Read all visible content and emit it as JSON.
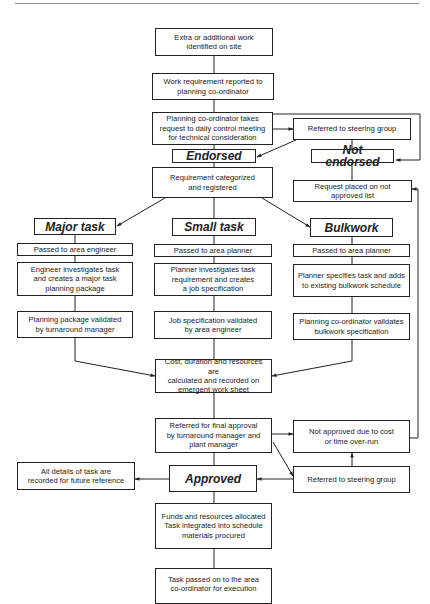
{
  "diagram": {
    "type": "flowchart",
    "nodes": {
      "extra_work": "Extra or additional work\nidentified on site",
      "work_requirement": "Work requirement reported to\nplanning co-ordinator",
      "planning_coordinator": "Planning co-ordinator takes\nrequest to daily control meeting\nfor technical consideration",
      "referred_steering_top": "Referred to steering group",
      "endorsed": "Endorsed",
      "not_endorsed": "Not  endorsed",
      "requirement_categorized": "Requirement categorized\nand registered",
      "request_not_approved_list": "Request placed on not\napproved list",
      "major_task": "Major  task",
      "small_task": "Small  task",
      "bulkwork": "Bulkwork",
      "passed_area_engineer": "Passed to area engineer",
      "passed_area_planner_small": "Passed to area planner",
      "passed_area_planner_bulk": "Passed to area planner",
      "engineer_investigates": "Engineer investigates task\nand creates a major task\nplanning package",
      "planner_investigates": "Planner investigates task\nrequirement and creates\na job specification",
      "planner_specifies": "Planner specifies task and adds\nto existing bulkwork schedule",
      "planning_package_validated": "Planning package validated\nby turnaround manager",
      "job_spec_validated": "Job specification validated\nby area engineer",
      "bulkwork_spec_validated": "Planning co-ordinator validates\nbulkwork specification",
      "cost_duration": "Cost, duration and resources are\ncalculated and recorded on\nemergent work sheet",
      "referred_final_approval": "Referred for final approval\nby turnaround manager and\nplant manager",
      "not_approved_cost": "Not approved due to cost\nor time over-run",
      "referred_steering_bottom": "Referred to steering group",
      "approved": "Approved",
      "all_details_recorded": "All details of task are\nrecorded for future reference",
      "funds_allocated": "Funds and resources allocated\nTask integrated into schedule\nmaterials procured",
      "task_passed_execution": "Task passed on to the area\nco-ordinator for execution"
    },
    "edges": [
      [
        "extra_work",
        "work_requirement"
      ],
      [
        "work_requirement",
        "planning_coordinator"
      ],
      [
        "planning_coordinator",
        "referred_steering_top"
      ],
      [
        "planning_coordinator",
        "endorsed"
      ],
      [
        "planning_coordinator",
        "not_endorsed"
      ],
      [
        "referred_steering_top",
        "endorsed"
      ],
      [
        "referred_steering_top",
        "not_endorsed"
      ],
      [
        "not_endorsed",
        "request_not_approved_list"
      ],
      [
        "endorsed",
        "requirement_categorized"
      ],
      [
        "requirement_categorized",
        "major_task"
      ],
      [
        "requirement_categorized",
        "small_task"
      ],
      [
        "requirement_categorized",
        "bulkwork"
      ],
      [
        "major_task",
        "passed_area_engineer"
      ],
      [
        "passed_area_engineer",
        "engineer_investigates"
      ],
      [
        "engineer_investigates",
        "planning_package_validated"
      ],
      [
        "planning_package_validated",
        "cost_duration"
      ],
      [
        "small_task",
        "passed_area_planner_small"
      ],
      [
        "passed_area_planner_small",
        "planner_investigates"
      ],
      [
        "planner_investigates",
        "job_spec_validated"
      ],
      [
        "job_spec_validated",
        "cost_duration"
      ],
      [
        "bulkwork",
        "passed_area_planner_bulk"
      ],
      [
        "passed_area_planner_bulk",
        "planner_specifies"
      ],
      [
        "planner_specifies",
        "bulkwork_spec_validated"
      ],
      [
        "bulkwork_spec_validated",
        "cost_duration"
      ],
      [
        "cost_duration",
        "referred_final_approval"
      ],
      [
        "referred_final_approval",
        "not_approved_cost"
      ],
      [
        "referred_final_approval",
        "referred_steering_bottom"
      ],
      [
        "referred_final_approval",
        "approved"
      ],
      [
        "referred_steering_bottom",
        "not_approved_cost"
      ],
      [
        "referred_steering_bottom",
        "approved"
      ],
      [
        "not_approved_cost",
        "request_not_approved_list"
      ],
      [
        "approved",
        "all_details_recorded"
      ],
      [
        "approved",
        "funds_allocated"
      ],
      [
        "funds_allocated",
        "task_passed_execution"
      ]
    ]
  }
}
